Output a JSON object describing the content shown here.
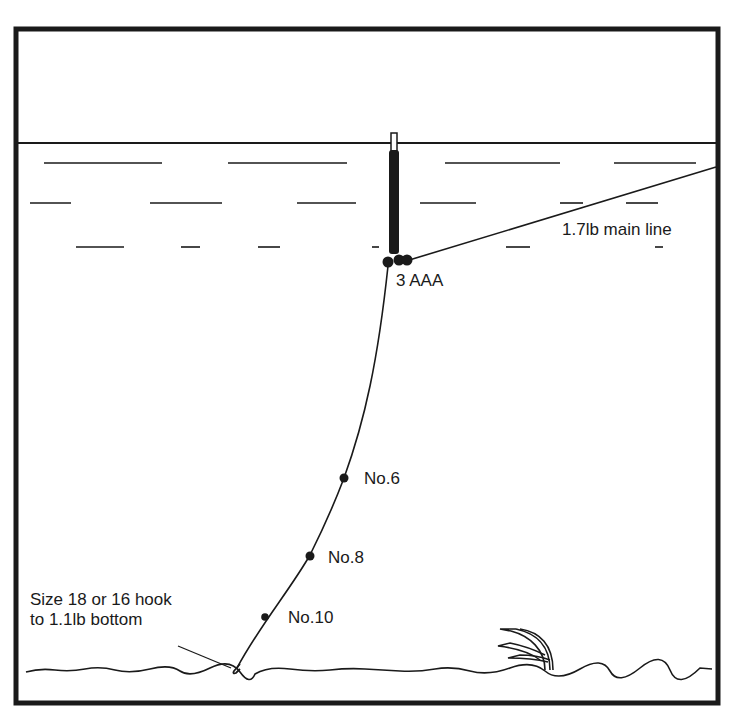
{
  "diagram": {
    "colors": {
      "ink": "#1a1a1a",
      "background": "#ffffff"
    },
    "labels": {
      "shot_bulk": "3 AAA",
      "main_line": "1.7lb main line",
      "shot_1": "No.6",
      "shot_2": "No.8",
      "shot_3": "No.10",
      "hook_line1": "Size 18 or 16 hook",
      "hook_line2": "to 1.1lb bottom"
    },
    "elements": [
      "frame",
      "water-surface",
      "ripple-lines",
      "float",
      "bulk-shot",
      "main-line",
      "hook-length",
      "split-shots",
      "hook",
      "river-bed",
      "weed"
    ]
  }
}
